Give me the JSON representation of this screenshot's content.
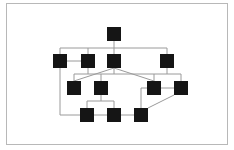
{
  "diagram": {
    "type": "hierarchy",
    "colors": {
      "node": "#151515",
      "edge": "#9a9a9a",
      "frame": "#b8b8b8",
      "background": "#ffffff"
    },
    "node_size": 14,
    "nodes": [
      {
        "id": "n1",
        "x": 107,
        "y": 27
      },
      {
        "id": "n2",
        "x": 53,
        "y": 54
      },
      {
        "id": "n3",
        "x": 81,
        "y": 54
      },
      {
        "id": "n4",
        "x": 107,
        "y": 54
      },
      {
        "id": "n5",
        "x": 160,
        "y": 54
      },
      {
        "id": "n6",
        "x": 67,
        "y": 81
      },
      {
        "id": "n7",
        "x": 94,
        "y": 81
      },
      {
        "id": "n8",
        "x": 147,
        "y": 81
      },
      {
        "id": "n9",
        "x": 174,
        "y": 81
      },
      {
        "id": "n10",
        "x": 80,
        "y": 108
      },
      {
        "id": "n11",
        "x": 107,
        "y": 108
      },
      {
        "id": "n12",
        "x": 134,
        "y": 108
      }
    ],
    "edges": [
      {
        "points": "114,41 114,54"
      },
      {
        "points": "60,54 60,48 167,48 167,54"
      },
      {
        "points": "88,48 88,54"
      },
      {
        "points": "67,61 81,61"
      },
      {
        "points": "88,68 88,74"
      },
      {
        "points": "74,81 74,74 181,74 181,81"
      },
      {
        "points": "114,68 114,74"
      },
      {
        "points": "167,68 167,74"
      },
      {
        "points": "101,74 101,81"
      },
      {
        "points": "154,74 154,81"
      },
      {
        "points": "114,68 74,81"
      },
      {
        "points": "114,68 154,81"
      },
      {
        "points": "161,88 174,88"
      },
      {
        "points": "101,95 101,101"
      },
      {
        "points": "87,108 87,101 114,101 114,108"
      },
      {
        "points": "60,68 60,115 80,115"
      },
      {
        "points": "94,115 107,115"
      },
      {
        "points": "121,115 134,115"
      },
      {
        "points": "141,108 141,88 147,88"
      },
      {
        "points": "148,108 174,95"
      }
    ]
  }
}
